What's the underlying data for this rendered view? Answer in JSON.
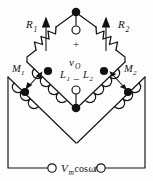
{
  "figure": {
    "background_color": "#fefefe",
    "ink_color": "#111111"
  },
  "components": {
    "r1": {
      "label": "R",
      "subscript": "1",
      "name": "variable-resistor-r1"
    },
    "r2": {
      "label": "R",
      "subscript": "2",
      "name": "variable-resistor-r2"
    },
    "l1": {
      "label": "L",
      "subscript": "1",
      "name": "inductor-l1"
    },
    "l2": {
      "label": "L",
      "subscript": "2",
      "name": "inductor-l2"
    },
    "m1": {
      "label": "M",
      "subscript": "1",
      "name": "mutual-inductance-m1"
    },
    "m2": {
      "label": "M",
      "subscript": "2",
      "name": "mutual-inductance-m2"
    }
  },
  "output_port": {
    "plus": "+",
    "minus": "−",
    "label": "v",
    "subscript": "O"
  },
  "source": {
    "amplitude": "V",
    "amplitude_subscript": "m",
    "waveform": "cos",
    "omega": "ω",
    "time": "t",
    "full_text": "Vm cosωt"
  }
}
